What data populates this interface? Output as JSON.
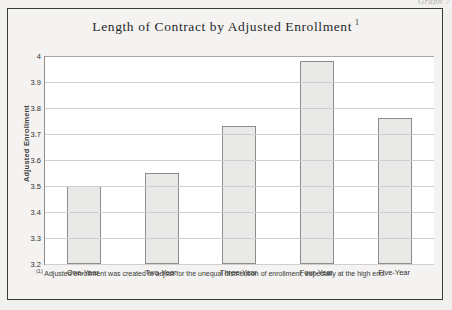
{
  "page": {
    "corner_label": "Graph 7"
  },
  "figure": {
    "title_main": "Length of Contract by Adjusted Enrollment",
    "title_footnote_marker": "1",
    "footnote_marker": "(1)",
    "footnote_text": "Adjusted enrollment was created to adjust for the unequal distribution of enrollment, especially at the high end."
  },
  "chart_data": {
    "type": "bar",
    "title": "Length of Contract by Adjusted Enrollment",
    "xlabel": "",
    "ylabel": "Adjusted Enrollment",
    "categories": [
      "One-Year",
      "Two-Year",
      "Three-Year",
      "Four-Year",
      "Five-Year"
    ],
    "values": [
      3.5,
      3.55,
      3.73,
      3.98,
      3.76
    ],
    "ylim": [
      3.2,
      4.0
    ],
    "ytick_step": 0.1,
    "yticks": [
      "4",
      "3.9",
      "3.8",
      "3.7",
      "3.6",
      "3.5",
      "3.4",
      "3.3",
      "3.2"
    ],
    "ytick_values": [
      4.0,
      3.9,
      3.8,
      3.7,
      3.6,
      3.5,
      3.4,
      3.3,
      3.2
    ],
    "grid": true,
    "legend": false,
    "bar_fill_color": "#e9e9e7",
    "bar_border_color": "#8d8d8b",
    "plot_background": "#ffffff",
    "gridline_color": "#cfcfcf"
  }
}
